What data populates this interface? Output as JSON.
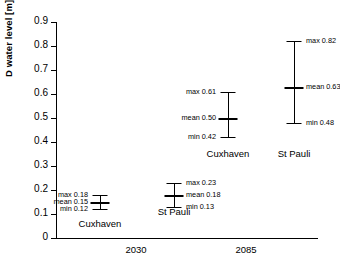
{
  "chart_data": {
    "type": "line",
    "title": "",
    "xlabel": "",
    "ylabel": "D water level  [m]",
    "ylim": [
      0,
      0.9
    ],
    "y_ticks": [
      "0",
      "0.1",
      "0.2",
      "0.3",
      "0.4",
      "0.5",
      "0.6",
      "0.7",
      "0.8",
      "0.9"
    ],
    "grid": false,
    "legend": "none",
    "categories": [
      "2030",
      "2085"
    ],
    "series": [
      {
        "name": "Cuxhaven",
        "group": "2030",
        "min": 0.12,
        "mean": 0.15,
        "max": 0.18,
        "label_side": "left",
        "min_label": "min 0.12",
        "mean_label": "mean 0.15",
        "max_label": "max 0.18"
      },
      {
        "name": "St Pauli",
        "group": "2030",
        "min": 0.13,
        "mean": 0.18,
        "max": 0.23,
        "label_side": "right",
        "min_label": "min 0.13",
        "mean_label": "mean 0.18",
        "max_label": "max 0.23"
      },
      {
        "name": "Cuxhaven",
        "group": "2085",
        "min": 0.42,
        "mean": 0.5,
        "max": 0.61,
        "label_side": "left",
        "min_label": "min 0.42",
        "mean_label": "mean 0.50",
        "max_label": "max 0.61"
      },
      {
        "name": "St Pauli",
        "group": "2085",
        "min": 0.48,
        "mean": 0.63,
        "max": 0.82,
        "label_side": "right",
        "min_label": "min 0.48",
        "mean_label": "mean 0.63",
        "max_label": "max 0.82"
      }
    ]
  },
  "axis": {
    "y_title": "D water level  [m]",
    "y_tick_labels": [
      "0.9",
      "0.8",
      "0.7",
      "0.6",
      "0.5",
      "0.4",
      "0.3",
      "0.2",
      "0.1",
      "0"
    ],
    "x_group_labels": [
      "2030",
      "2085"
    ]
  },
  "series_names": {
    "s0": "Cuxhaven",
    "s1": "St Pauli",
    "s2": "Cuxhaven",
    "s3": "St Pauli"
  },
  "values": {
    "s0": {
      "max": "max 0.18",
      "mean": "mean 0.15",
      "min": "min 0.12"
    },
    "s1": {
      "max": "max 0.23",
      "mean": "mean 0.18",
      "min": "min 0.13"
    },
    "s2": {
      "max": "max 0.61",
      "mean": "mean 0.50",
      "min": "min 0.42"
    },
    "s3": {
      "max": "max 0.82",
      "mean": "mean 0.63",
      "min": "min 0.48"
    }
  }
}
